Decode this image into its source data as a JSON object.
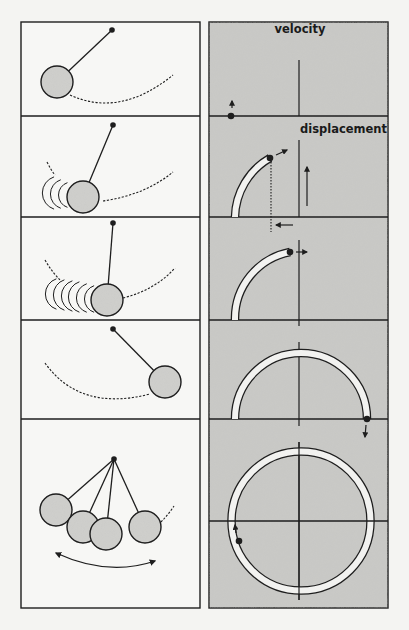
{
  "figure": {
    "width": 409,
    "height": 630,
    "background": "#f4f4f2",
    "ink_color": "#1e1e1e",
    "panel_fill_left": "#f7f7f5",
    "panel_fill_right": "#c9c9c6",
    "bob_fill": "#cfcfcc",
    "trail_fill": "#f2f2f0"
  },
  "layout": {
    "left_panel": {
      "x": 21,
      "y": 22,
      "w": 179,
      "h": 586
    },
    "right_panel": {
      "x": 209,
      "y": 22,
      "w": 179,
      "h": 586
    },
    "row_dividers_y": [
      116,
      217,
      320,
      419
    ],
    "phase_origin_x": 299
  },
  "labels": {
    "velocity": "velocity",
    "displacement": "displacement"
  },
  "pendulum_rows": [
    {
      "name": "pendulum-row-1",
      "pivot": [
        112,
        30
      ],
      "bobs": [
        [
          57,
          82
        ]
      ],
      "bob_radius": 16,
      "dashed_arcs": [
        "M 70 95 Q 120 118 173 75"
      ],
      "motion_arcs": []
    },
    {
      "name": "pendulum-row-2",
      "pivot": [
        113,
        125
      ],
      "bobs": [
        [
          83,
          197
        ]
      ],
      "bob_radius": 16,
      "dashed_arcs": [
        "M 103 201 Q 145 195 173 172",
        "M 47 162 Q 51 170 55 175"
      ],
      "motion_arcs": [
        [
          72,
          195,
          13
        ],
        [
          66,
          194,
          15
        ],
        [
          60,
          193,
          17
        ]
      ]
    },
    {
      "name": "pendulum-row-3",
      "pivot": [
        113,
        223
      ],
      "bobs": [
        [
          107,
          300
        ]
      ],
      "bob_radius": 16,
      "dashed_arcs": [
        "M 123 298 Q 155 290 175 268",
        "M 45 260 Q 52 272 60 280"
      ],
      "motion_arcs": [
        [
          99,
          299,
          14
        ],
        [
          92,
          298,
          15
        ],
        [
          85,
          297,
          16
        ],
        [
          78,
          296,
          16
        ],
        [
          70,
          295,
          16
        ],
        [
          62,
          294,
          16
        ]
      ]
    },
    {
      "name": "pendulum-row-4",
      "pivot": [
        113,
        329
      ],
      "bobs": [
        [
          165,
          382
        ]
      ],
      "bob_radius": 16,
      "dashed_arcs": [
        "M 45 363 Q 80 412 150 394"
      ],
      "motion_arcs": []
    },
    {
      "name": "pendulum-row-5",
      "pivot": [
        114,
        459
      ],
      "bobs": [
        [
          56,
          510
        ],
        [
          83,
          527
        ],
        [
          106,
          534
        ],
        [
          145,
          527
        ]
      ],
      "bob_radius": 16,
      "dashed_arcs": [
        "M 161 522 Q 168 515 174 506"
      ],
      "motion_arcs": [],
      "swing_arrow": "M 56 553 Q 108 577 155 561"
    }
  ],
  "phase_rows": [
    {
      "name": "phase-row-1",
      "axis_y": 116,
      "axis_x_top": 60,
      "axis_x_bottom": 116,
      "trail": null,
      "point": [
        231,
        116
      ],
      "arrows": [
        {
          "from": [
            232,
            108
          ],
          "to": [
            232,
            101
          ]
        }
      ]
    },
    {
      "name": "phase-row-2",
      "axis_y": 217,
      "axis_x_top": 140,
      "axis_x_bottom": 217,
      "trail": "M 235 217 A 70 70 0 0 1 270 158",
      "point": [
        270,
        158
      ],
      "dotted_drop": [
        [
          271,
          162
        ],
        [
          271,
          232
        ]
      ],
      "arrows": [
        {
          "from": [
            276,
            155
          ],
          "to": [
            287,
            150
          ]
        },
        {
          "from": [
            293,
            225
          ],
          "to": [
            276,
            225
          ]
        },
        {
          "from": [
            307,
            206
          ],
          "to": [
            307,
            167
          ]
        }
      ]
    },
    {
      "name": "phase-row-3",
      "axis_y": 320,
      "axis_x_top": 240,
      "axis_x_bottom": 326,
      "trail": "M 235 320 A 68 68 0 0 1 290 252",
      "point": [
        290,
        252
      ],
      "arrows": [
        {
          "from": [
            296,
            252
          ],
          "to": [
            307,
            252
          ]
        }
      ]
    },
    {
      "name": "phase-row-4",
      "axis_y": 419,
      "axis_x_top": 342,
      "axis_x_bottom": 426,
      "trail": "M 235 419 A 66 66 0 0 1 367 419",
      "point": [
        367,
        419
      ],
      "arrows": [
        {
          "from": [
            366,
            425
          ],
          "to": [
            365,
            437
          ]
        }
      ]
    },
    {
      "name": "phase-row-5",
      "axis_y": 521,
      "axis_x_top": 442,
      "axis_x_bottom": 600,
      "trail": "M 239 541 A 66 66 0 1 1 235 521",
      "point": [
        239,
        541
      ],
      "arrows": [
        {
          "from": [
            236,
            533
          ],
          "to": [
            235,
            525
          ]
        }
      ],
      "circle": {
        "cx": 301,
        "cy": 521,
        "r": 66
      }
    }
  ]
}
